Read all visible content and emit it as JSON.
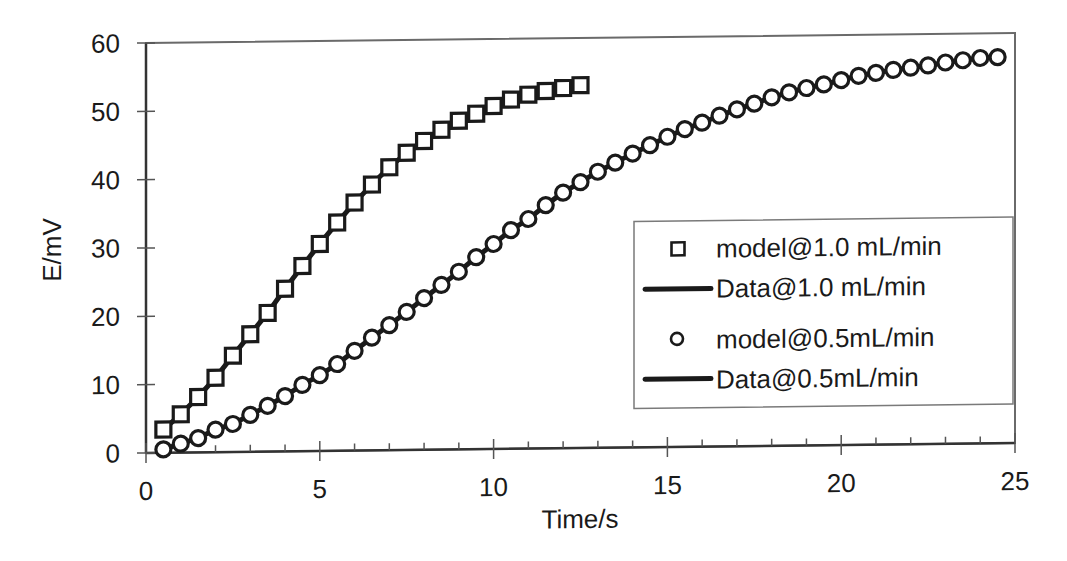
{
  "chart_data": {
    "type": "scatter",
    "title": "",
    "xlabel": "Time/s",
    "ylabel": "E/mV",
    "xlim": [
      0,
      25
    ],
    "ylim": [
      0,
      60
    ],
    "xticks": [
      0,
      5,
      10,
      15,
      20,
      25
    ],
    "yticks": [
      0,
      10,
      20,
      30,
      40,
      50,
      60
    ],
    "x_minor_tick_step": 1,
    "grid": false,
    "legend_position": "center-right (inside plot)",
    "legend": [
      {
        "label": "model@1.0 mL/min",
        "marker": "square-open",
        "line": false
      },
      {
        "label": "Data@1.0 mL/min",
        "marker": "none",
        "line": true
      },
      {
        "label": "model@0.5mL/min",
        "marker": "circle-open",
        "line": false
      },
      {
        "label": "Data@0.5mL/min",
        "marker": "none",
        "line": true
      }
    ],
    "series": [
      {
        "name": "model@1.0 mL/min",
        "style": "square-open",
        "x": [
          0.5,
          1.0,
          1.5,
          2.0,
          2.5,
          3.0,
          3.5,
          4.0,
          4.5,
          5.0,
          5.5,
          6.0,
          6.5,
          7.0,
          7.5,
          8.0,
          8.5,
          9.0,
          9.5,
          10.0,
          10.5,
          11.0,
          11.5,
          12.0,
          12.5
        ],
        "y": [
          3.4,
          5.6,
          8.1,
          10.9,
          14.1,
          17.2,
          20.3,
          23.8,
          27.1,
          30.3,
          33.4,
          36.3,
          38.9,
          41.4,
          43.5,
          45.2,
          46.8,
          48.1,
          49.1,
          50.2,
          51.1,
          51.8,
          52.3,
          52.7,
          53.1
        ]
      },
      {
        "name": "Data@1.0 mL/min",
        "style": "line",
        "x": [
          0.5,
          1.0,
          1.5,
          2.0,
          2.5,
          3.0,
          3.5,
          4.0,
          4.5,
          5.0,
          5.5,
          6.0,
          6.5,
          7.0,
          7.5,
          8.0,
          8.5,
          9.0,
          9.5,
          10.0,
          10.5,
          11.0,
          11.5,
          12.0,
          12.5
        ],
        "y": [
          3.4,
          5.6,
          8.1,
          10.9,
          14.1,
          17.2,
          20.3,
          23.8,
          27.1,
          30.3,
          33.4,
          36.3,
          38.9,
          41.4,
          43.5,
          45.2,
          46.8,
          48.1,
          49.1,
          50.2,
          51.1,
          51.8,
          52.3,
          52.7,
          53.1
        ]
      },
      {
        "name": "model@0.5mL/min",
        "style": "circle-open",
        "x": [
          0.5,
          1.0,
          1.5,
          2.0,
          2.5,
          3.0,
          3.5,
          4.0,
          4.5,
          5.0,
          5.5,
          6.0,
          6.5,
          7.0,
          7.5,
          8.0,
          8.5,
          9.0,
          9.5,
          10.0,
          10.5,
          11.0,
          11.5,
          12.0,
          12.5,
          13.0,
          13.5,
          14.0,
          14.5,
          15.0,
          15.5,
          16.0,
          16.5,
          17.0,
          17.5,
          18.0,
          18.5,
          19.0,
          19.5,
          20.0,
          20.5,
          21.0,
          21.5,
          22.0,
          22.5,
          23.0,
          23.5,
          24.0,
          24.5
        ],
        "y": [
          0.5,
          1.3,
          2.1,
          3.3,
          4.1,
          5.4,
          6.7,
          8.1,
          9.7,
          11.1,
          12.7,
          14.6,
          16.5,
          18.3,
          20.2,
          22.2,
          24.1,
          26.0,
          28.1,
          30.0,
          32.0,
          33.6,
          35.6,
          37.4,
          38.9,
          40.4,
          41.7,
          43.0,
          44.2,
          45.4,
          46.5,
          47.4,
          48.4,
          49.3,
          50.1,
          51.0,
          51.7,
          52.3,
          52.8,
          53.4,
          54.0,
          54.4,
          54.8,
          55.1,
          55.4,
          55.8,
          56.1,
          56.4,
          56.5
        ]
      },
      {
        "name": "Data@0.5mL/min",
        "style": "line",
        "x": [
          0.5,
          1.0,
          1.5,
          2.0,
          2.5,
          3.0,
          3.5,
          4.0,
          4.5,
          5.0,
          5.5,
          6.0,
          6.5,
          7.0,
          7.5,
          8.0,
          8.5,
          9.0,
          9.5,
          10.0,
          10.5,
          11.0,
          11.5,
          12.0,
          12.5,
          13.0,
          13.5,
          14.0,
          14.5,
          15.0,
          15.5,
          16.0,
          16.5,
          17.0,
          17.5,
          18.0,
          18.5,
          19.0,
          19.5,
          20.0,
          20.5,
          21.0,
          21.5,
          22.0,
          22.5,
          23.0,
          23.5,
          24.0,
          24.5
        ],
        "y": [
          0.5,
          1.3,
          2.1,
          3.3,
          4.1,
          5.4,
          6.7,
          8.1,
          9.7,
          11.1,
          12.7,
          14.6,
          16.5,
          18.3,
          20.2,
          22.2,
          24.1,
          26.0,
          28.1,
          30.0,
          32.0,
          33.6,
          35.6,
          37.4,
          38.9,
          40.4,
          41.7,
          43.0,
          44.2,
          45.4,
          46.5,
          47.4,
          48.4,
          49.3,
          50.1,
          51.0,
          51.7,
          52.3,
          52.8,
          53.4,
          54.0,
          54.4,
          54.8,
          55.1,
          55.4,
          55.8,
          56.1,
          56.4,
          56.5
        ]
      }
    ]
  },
  "colors": {
    "ink": "#1a1a1a",
    "frame": "#6a6a6a",
    "background": "#ffffff"
  }
}
